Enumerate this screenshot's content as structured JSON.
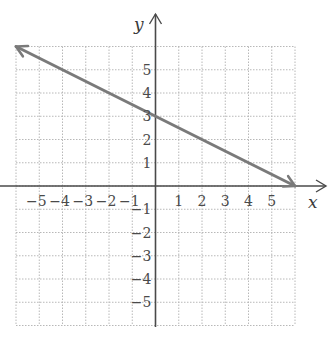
{
  "chart_data": {
    "type": "line",
    "title": "",
    "xlabel": "x",
    "ylabel": "y",
    "xlim": [
      -6,
      6
    ],
    "ylim": [
      -6,
      6
    ],
    "grid": true,
    "grid_style": "dotted",
    "x_ticks": [
      -5,
      -4,
      -3,
      -2,
      -1,
      1,
      2,
      3,
      4,
      5
    ],
    "y_ticks": [
      -5,
      -4,
      -3,
      -2,
      -1,
      1,
      2,
      3,
      4,
      5
    ],
    "x_tick_labels": [
      "−5",
      "−4",
      "−3",
      "−2",
      "−1",
      "1",
      "2",
      "3",
      "4",
      "5"
    ],
    "y_tick_labels": [
      "−5",
      "−4",
      "−3",
      "−2",
      "−1",
      "1",
      "2",
      "3",
      "4",
      "5"
    ],
    "series": [
      {
        "name": "y = -x/2 + 3",
        "equation": "y = -0.5x + 3",
        "slope": -0.5,
        "y_intercept": 3,
        "x": [
          -6,
          0,
          6
        ],
        "y": [
          6,
          3,
          0
        ],
        "arrows": "both",
        "color": "#7a7a7a"
      }
    ],
    "legend": null
  },
  "colors": {
    "axis": "#4a4a4a",
    "grid": "#b8b8b8",
    "line": "#7a7a7a",
    "text": "#4a4a4a"
  }
}
